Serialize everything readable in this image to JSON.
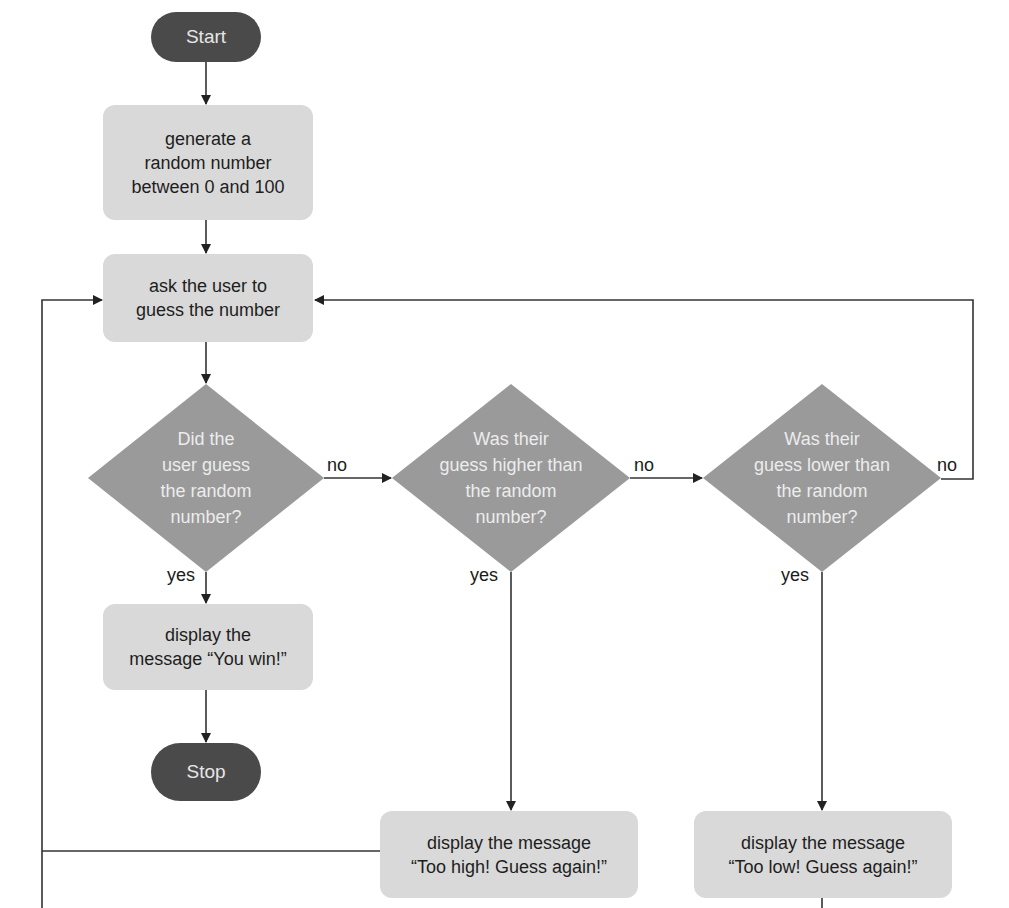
{
  "diagram": {
    "type": "flowchart",
    "colors": {
      "terminal_fill": "#4a4a4a",
      "terminal_text": "#e6e6e6",
      "process_fill": "#d9d9d9",
      "process_text": "#1e1e1e",
      "decision_fill": "#9a9a9a",
      "decision_text": "#ececec",
      "line": "#333333"
    },
    "nodes": {
      "start": {
        "label": "Start"
      },
      "generate": {
        "label": "generate a\nrandom number\nbetween 0 and 100"
      },
      "ask": {
        "label": "ask the user to\nguess the number"
      },
      "decision_correct": {
        "label": "Did the\nuser guess\nthe random\nnumber?"
      },
      "decision_higher": {
        "label": "Was their\nguess higher than\nthe random\nnumber?"
      },
      "decision_lower": {
        "label": "Was their\nguess lower than\nthe random\nnumber?"
      },
      "win": {
        "label": "display the\nmessage “You win!”"
      },
      "stop": {
        "label": "Stop"
      },
      "too_high": {
        "label": "display the message\n“Too high! Guess again!”"
      },
      "too_low": {
        "label": "display the message\n“Too low! Guess again!”"
      }
    },
    "edge_labels": {
      "correct_no": "no",
      "correct_yes": "yes",
      "higher_no": "no",
      "higher_yes": "yes",
      "lower_no": "no",
      "lower_yes": "yes"
    },
    "edges": [
      {
        "from": "start",
        "to": "generate"
      },
      {
        "from": "generate",
        "to": "ask"
      },
      {
        "from": "ask",
        "to": "decision_correct"
      },
      {
        "from": "decision_correct",
        "to": "win",
        "label": "yes"
      },
      {
        "from": "decision_correct",
        "to": "decision_higher",
        "label": "no"
      },
      {
        "from": "decision_higher",
        "to": "too_high",
        "label": "yes"
      },
      {
        "from": "decision_higher",
        "to": "decision_lower",
        "label": "no"
      },
      {
        "from": "decision_lower",
        "to": "too_low",
        "label": "yes"
      },
      {
        "from": "decision_lower",
        "to": "ask",
        "label": "no"
      },
      {
        "from": "win",
        "to": "stop"
      },
      {
        "from": "too_high",
        "to": "ask"
      },
      {
        "from": "too_low",
        "to": "ask"
      }
    ]
  }
}
